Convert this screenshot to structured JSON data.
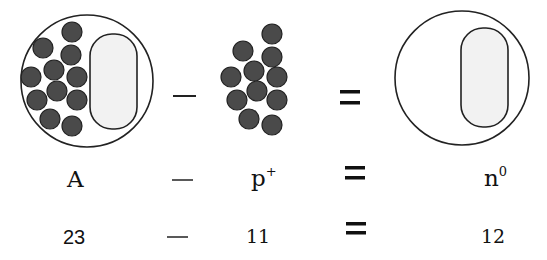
{
  "diagram": {
    "colors": {
      "particle": "#4a4a4a",
      "outline": "#222222",
      "neutral_region": "#f2f2f2",
      "background": "#ffffff"
    },
    "row_icons": {
      "atom_with_protons": {
        "circle": {
          "cx": 87,
          "cy": 81,
          "r": 66
        },
        "region": {
          "x": 90,
          "y": 34,
          "w": 47,
          "h": 95,
          "rx": 22
        }
      },
      "protons_cluster": {
        "count": 11
      },
      "atom_neutrons_only": {
        "circle": {
          "cx": 462,
          "cy": 78,
          "r": 67
        },
        "region": {
          "x": 461,
          "y": 28,
          "w": 47,
          "h": 99,
          "rx": 22
        }
      }
    },
    "operators": {
      "minus": "—",
      "equals": "="
    },
    "symbols_row": {
      "mass_number": "A",
      "proton_base": "p",
      "proton_sup": "+",
      "neutron_base": "n",
      "neutron_sup": "0"
    },
    "values_row": {
      "mass_number": "23",
      "protons": "11",
      "neutrons": "12"
    }
  }
}
